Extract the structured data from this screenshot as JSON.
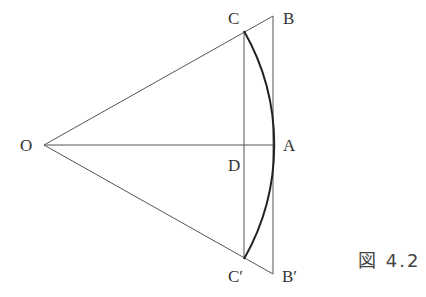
{
  "figure": {
    "caption": "図 4.2",
    "points": {
      "O": {
        "label": "O",
        "x": 44,
        "y": 145
      },
      "A": {
        "label": "A",
        "x": 274,
        "y": 145
      },
      "B": {
        "label": "B",
        "x": 273,
        "y": 16
      },
      "B_prime": {
        "label": "B′",
        "x": 273,
        "y": 274
      },
      "C": {
        "label": "C",
        "x": 244,
        "y": 31
      },
      "C_prime": {
        "label": "C′",
        "x": 244,
        "y": 259
      },
      "D": {
        "label": "D",
        "x": 244,
        "y": 145
      }
    },
    "segments": [
      "OB",
      "OB′",
      "OA",
      "BB′",
      "CC′"
    ],
    "arc": "C–A–C′ (centered at O)",
    "colors": {
      "line": "#444444",
      "arc": "#222222",
      "text": "#333333"
    }
  }
}
